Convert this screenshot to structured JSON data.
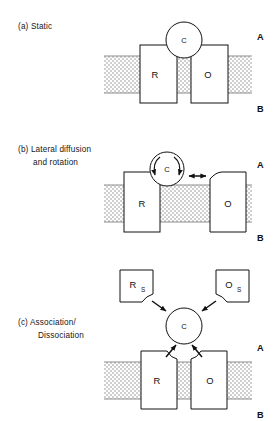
{
  "figure": {
    "background_color": "#ffffff",
    "ink_color": "#111111",
    "membrane_fill_color": "#d8d8d8",
    "membrane_edge_color": "#8c8c8c"
  },
  "panels": [
    {
      "id": "a",
      "caption_lines": [
        "(a) Static"
      ],
      "compartment_top": "A",
      "compartment_bottom": "B",
      "nodes": [
        {
          "name": "receptor",
          "label": "R",
          "sub": ""
        },
        {
          "name": "effector",
          "label": "O",
          "sub": ""
        },
        {
          "name": "carrier",
          "label": "C",
          "sub": ""
        }
      ],
      "motion_annotations": []
    },
    {
      "id": "b",
      "caption_lines": [
        "(b) Lateral diffusion",
        "and rotation"
      ],
      "compartment_top": "A",
      "compartment_bottom": "B",
      "nodes": [
        {
          "name": "receptor",
          "label": "R",
          "sub": ""
        },
        {
          "name": "effector",
          "label": "O",
          "sub": ""
        },
        {
          "name": "carrier",
          "label": "C",
          "sub": ""
        }
      ],
      "motion_annotations": [
        {
          "name": "rotation-arrow-left",
          "type": "curved-arrow"
        },
        {
          "name": "rotation-arrow-right",
          "type": "curved-arrow"
        },
        {
          "name": "lateral-diffusion-arrow",
          "type": "double-headed-arrow"
        }
      ]
    },
    {
      "id": "c",
      "caption_lines": [
        "(c) Association/",
        "Dissociation"
      ],
      "compartment_top": "A",
      "compartment_bottom": "B",
      "nodes": [
        {
          "name": "receptor",
          "label": "R",
          "sub": ""
        },
        {
          "name": "effector",
          "label": "O",
          "sub": ""
        },
        {
          "name": "carrier",
          "label": "C",
          "sub": ""
        },
        {
          "name": "receptor-substrate",
          "label": "R",
          "sub": "S"
        },
        {
          "name": "effector-substrate",
          "label": "O",
          "sub": "S"
        }
      ],
      "motion_annotations": [
        {
          "name": "association-arrow-upper-left",
          "type": "arrow"
        },
        {
          "name": "association-arrow-upper-right",
          "type": "arrow"
        },
        {
          "name": "association-arrow-lower-left",
          "type": "arrow"
        },
        {
          "name": "association-arrow-lower-right",
          "type": "arrow"
        }
      ]
    }
  ]
}
